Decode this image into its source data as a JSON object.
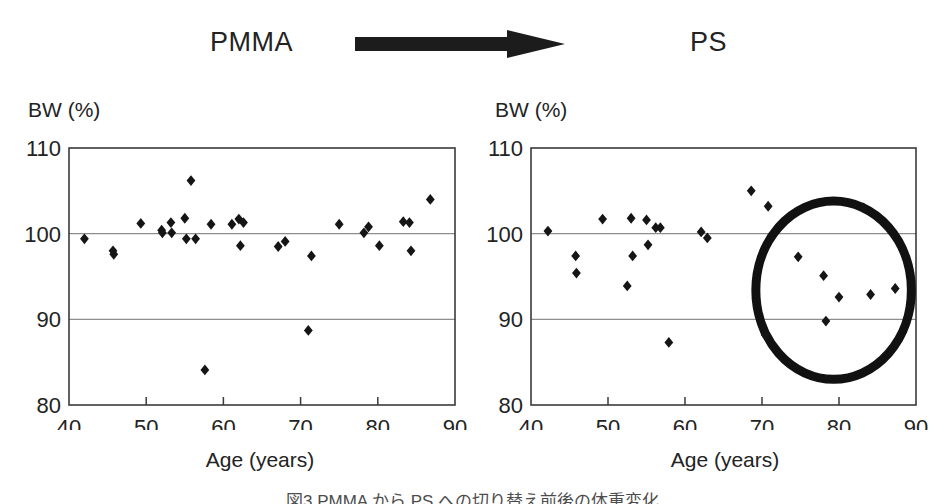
{
  "header": {
    "left_label": "PMMA",
    "right_label": "PS",
    "arrow_icon": "right-arrow-icon"
  },
  "caption": "図3 PMMA から PS への切り替え前後の体重変化",
  "chart_data": [
    {
      "type": "scatter",
      "title": "PMMA",
      "xlabel": "Age (years)",
      "ylabel": "BW (%)",
      "xlim": [
        40,
        90
      ],
      "ylim": [
        80,
        110
      ],
      "xticks": [
        40,
        50,
        60,
        70,
        80,
        90
      ],
      "yticks": [
        80,
        90,
        100,
        110
      ],
      "gridlines_y": [
        90,
        100
      ],
      "grid": true,
      "marker": "diamond",
      "series": [
        {
          "name": "PMMA patients",
          "points": [
            [
              42.0,
              99.4
            ],
            [
              45.7,
              98.0
            ],
            [
              45.8,
              97.6
            ],
            [
              49.3,
              101.2
            ],
            [
              52.0,
              100.4
            ],
            [
              52.1,
              100.1
            ],
            [
              53.2,
              101.3
            ],
            [
              53.3,
              100.1
            ],
            [
              55.0,
              101.8
            ],
            [
              55.2,
              99.4
            ],
            [
              55.8,
              106.2
            ],
            [
              56.4,
              99.4
            ],
            [
              57.6,
              84.1
            ],
            [
              58.4,
              101.1
            ],
            [
              61.1,
              101.1
            ],
            [
              62.0,
              101.7
            ],
            [
              62.2,
              98.6
            ],
            [
              62.6,
              101.3
            ],
            [
              67.1,
              98.5
            ],
            [
              68.0,
              99.1
            ],
            [
              71.0,
              88.7
            ],
            [
              71.4,
              97.4
            ],
            [
              75.0,
              101.1
            ],
            [
              78.2,
              100.1
            ],
            [
              78.8,
              100.8
            ],
            [
              80.2,
              98.6
            ],
            [
              83.3,
              101.4
            ],
            [
              84.1,
              101.3
            ],
            [
              84.3,
              98.0
            ],
            [
              86.8,
              104.0
            ]
          ]
        }
      ]
    },
    {
      "type": "scatter",
      "title": "PS",
      "xlabel": "Age (years)",
      "ylabel": "BW (%)",
      "xlim": [
        40,
        90
      ],
      "ylim": [
        80,
        110
      ],
      "xticks": [
        40,
        50,
        60,
        70,
        80,
        90
      ],
      "yticks": [
        80,
        90,
        100,
        110
      ],
      "gridlines_y": [
        90,
        100
      ],
      "grid": true,
      "marker": "diamond",
      "annotation": {
        "kind": "ellipse-highlight",
        "name": "low-bw-cluster-highlight",
        "x_center": 79.3,
        "y_center": 93.4,
        "x_radius": 10.1,
        "y_radius": 10.4,
        "color": "#111111"
      },
      "series": [
        {
          "name": "PS patients",
          "points": [
            [
              42.2,
              100.3
            ],
            [
              45.8,
              97.4
            ],
            [
              45.9,
              95.4
            ],
            [
              49.3,
              101.7
            ],
            [
              52.5,
              93.9
            ],
            [
              53.0,
              101.8
            ],
            [
              53.2,
              97.4
            ],
            [
              55.0,
              101.6
            ],
            [
              55.2,
              98.7
            ],
            [
              56.2,
              100.7
            ],
            [
              56.8,
              100.7
            ],
            [
              57.9,
              87.3
            ],
            [
              62.1,
              100.2
            ],
            [
              62.9,
              99.5
            ],
            [
              68.6,
              105.0
            ],
            [
              70.4,
              88.2
            ],
            [
              70.8,
              103.2
            ],
            [
              74.7,
              97.3
            ],
            [
              78.0,
              95.1
            ],
            [
              78.3,
              89.8
            ],
            [
              80.0,
              92.6
            ],
            [
              83.2,
              103.0
            ],
            [
              84.1,
              92.9
            ],
            [
              87.3,
              93.6
            ]
          ]
        }
      ]
    }
  ]
}
